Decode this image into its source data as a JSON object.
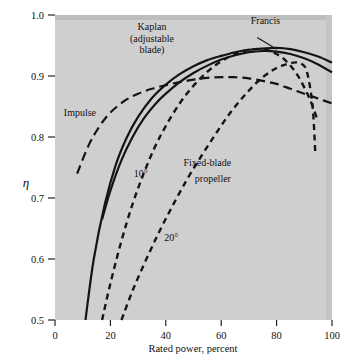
{
  "chart_data": {
    "type": "line",
    "title": "",
    "xlabel": "Rated power, percent",
    "ylabel": "η",
    "xlim": [
      0,
      100
    ],
    "ylim": [
      0.5,
      1.0
    ],
    "xticks": [
      0,
      20,
      40,
      60,
      80,
      100
    ],
    "xtick_labels": [
      "0",
      "20",
      "40",
      "60",
      "80",
      "100"
    ],
    "yticks": [
      0.5,
      0.6,
      0.7,
      0.8,
      0.9,
      1.0
    ],
    "ytick_labels": [
      "0.5",
      "0.6",
      "0.7",
      "0.8",
      "0.9",
      "1.0"
    ],
    "grid": false,
    "legend": "inline-annotations",
    "plot_background": "#cfcfcf",
    "series": [
      {
        "name": "Impulse",
        "style": "long-dashed",
        "label": "Impulse",
        "label_x": 9,
        "label_y": 0.835,
        "x": [
          8,
          12,
          16,
          20,
          25,
          30,
          35,
          40,
          45,
          50,
          55,
          60,
          65,
          70,
          75,
          80,
          85,
          90,
          95,
          100
        ],
        "y": [
          0.74,
          0.785,
          0.817,
          0.84,
          0.859,
          0.871,
          0.879,
          0.885,
          0.89,
          0.894,
          0.897,
          0.898,
          0.898,
          0.896,
          0.892,
          0.887,
          0.879,
          0.871,
          0.863,
          0.855
        ]
      },
      {
        "name": "Kaplan (adjustable blade)",
        "style": "solid",
        "label": "Kaplan\n(adjustable\nblade)",
        "label_lines": [
          "Kaplan",
          "(adjustable",
          "blade)"
        ],
        "label_x": 35,
        "label_y": 0.975,
        "x": [
          11,
          14,
          18,
          22,
          26,
          30,
          35,
          40,
          45,
          50,
          55,
          60,
          65,
          70,
          75,
          80,
          85,
          90,
          95,
          100
        ],
        "y": [
          0.5,
          0.6,
          0.69,
          0.755,
          0.8,
          0.833,
          0.864,
          0.886,
          0.903,
          0.916,
          0.926,
          0.933,
          0.939,
          0.943,
          0.945,
          0.946,
          0.944,
          0.939,
          0.932,
          0.922
        ]
      },
      {
        "name": "Francis",
        "style": "solid",
        "label": "Francis",
        "label_x": 76,
        "label_y": 0.985,
        "leader_from_x": 73,
        "leader_from_y": 0.963,
        "leader_to_x": 80,
        "leader_to_y": 0.944,
        "x": [
          17,
          20,
          24,
          28,
          32,
          36,
          40,
          45,
          50,
          55,
          60,
          65,
          70,
          75,
          80,
          85,
          90,
          95,
          100
        ],
        "y": [
          0.665,
          0.712,
          0.762,
          0.8,
          0.83,
          0.853,
          0.871,
          0.89,
          0.905,
          0.917,
          0.927,
          0.934,
          0.939,
          0.941,
          0.94,
          0.936,
          0.929,
          0.919,
          0.906
        ]
      },
      {
        "name": "Fixed-blade propeller 10 degrees",
        "style": "short-dashed",
        "label": "10°",
        "label_x": 31,
        "label_y": 0.735,
        "x": [
          17,
          20,
          24,
          28,
          32,
          36,
          40,
          45,
          50,
          55,
          60,
          65,
          70,
          73,
          76,
          80,
          84,
          88,
          92,
          95
        ],
        "y": [
          0.5,
          0.56,
          0.63,
          0.69,
          0.74,
          0.783,
          0.818,
          0.855,
          0.884,
          0.907,
          0.924,
          0.936,
          0.943,
          0.944,
          0.943,
          0.936,
          0.922,
          0.898,
          0.862,
          0.825
        ]
      },
      {
        "name": "Fixed-blade propeller 20 degrees",
        "style": "short-dashed",
        "label": "20°",
        "label_x": 42,
        "label_y": 0.63,
        "x": [
          24,
          28,
          33,
          38,
          43,
          48,
          53,
          58,
          63,
          68,
          73,
          78,
          82,
          86,
          89,
          91,
          93,
          94
        ],
        "y": [
          0.5,
          0.548,
          0.6,
          0.648,
          0.692,
          0.733,
          0.77,
          0.805,
          0.838,
          0.866,
          0.89,
          0.908,
          0.917,
          0.922,
          0.92,
          0.906,
          0.85,
          0.77
        ]
      }
    ],
    "annotations": [
      {
        "text": "Fixed-blade",
        "x": 55,
        "y": 0.752
      },
      {
        "text": "propeller",
        "x": 57,
        "y": 0.727
      }
    ]
  }
}
